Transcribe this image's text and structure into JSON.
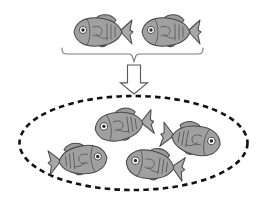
{
  "figure": {
    "canvas": {
      "width": 265,
      "height": 206,
      "background": "#ffffff"
    },
    "colors": {
      "fish_body": "#a0a0a0",
      "fish_head": "#b4b4b4",
      "fish_belly": "#8e8e8e",
      "fish_outline": "#4a4a4a",
      "eye_pupil": "#2b2b2b",
      "eye_ring": "#ffffff",
      "brace": "#7d7d7d",
      "arrow_fill": "#ffffff",
      "arrow_outline": "#5a5a5a",
      "boundary": "#111111"
    }
  },
  "parents": {
    "label": "Parent fish",
    "count": 2,
    "items": [
      {
        "name": "parent-fish-left",
        "cx": 100,
        "cy": 32,
        "scale": 1.0,
        "rotation": 0,
        "facing": "left"
      },
      {
        "name": "parent-fish-right",
        "cx": 168,
        "cy": 32,
        "scale": 1.0,
        "rotation": 0,
        "facing": "left"
      }
    ]
  },
  "brace": {
    "label": "grouping-brace",
    "x_start": 62,
    "x_end": 203,
    "y": 54,
    "point_x": 134,
    "point_y": 62,
    "orientation": "down"
  },
  "arrow": {
    "label": "produces-arrow",
    "direction": "down",
    "x": 134,
    "y_top": 65,
    "y_bottom": 94,
    "shaft_width": 13,
    "head_width": 27,
    "fill": "hollow"
  },
  "population": {
    "label": "Offspring population",
    "boundary": {
      "name": "population-boundary",
      "shape": "ellipse",
      "cx": 133.5,
      "cy": 143,
      "rx": 114,
      "ry": 47,
      "stroke_style": "dashed"
    },
    "count": 4,
    "items": [
      {
        "name": "offspring-fish-top",
        "cx": 121,
        "cy": 126,
        "scale": 1.0,
        "rotation": -8,
        "facing": "left"
      },
      {
        "name": "offspring-fish-right",
        "cx": 194,
        "cy": 140,
        "scale": 1.02,
        "rotation": -10,
        "facing": "right"
      },
      {
        "name": "offspring-fish-bottom-left",
        "cx": 81,
        "cy": 160,
        "scale": 1.0,
        "rotation": 5,
        "facing": "right"
      },
      {
        "name": "offspring-fish-bottom-center",
        "cx": 152,
        "cy": 165,
        "scale": 1.0,
        "rotation": 8,
        "facing": "left"
      }
    ]
  }
}
